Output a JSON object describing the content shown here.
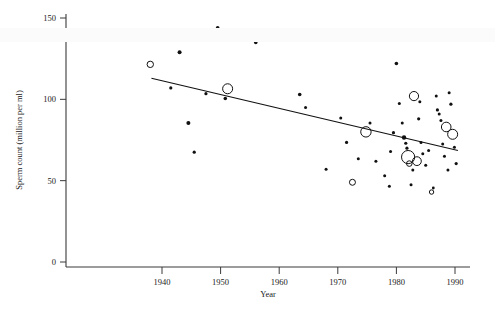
{
  "figure": {
    "title": "",
    "background_color": "#ffffff",
    "point_color": "#111111"
  },
  "axes": {
    "x_title": "Year",
    "y_title": "Sperm count (million per ml)",
    "x_ticks": [
      "1940",
      "1950",
      "1960",
      "1970",
      "1980",
      "1990"
    ],
    "y_ticks": [
      "0",
      "50",
      "100",
      "150"
    ]
  },
  "chart_data": {
    "type": "scatter",
    "title": "",
    "xlabel": "Year",
    "ylabel": "Sperm count (million per ml)",
    "xlim": [
      1936,
      1992
    ],
    "ylim": [
      0,
      155
    ],
    "xticks": [
      1940,
      1950,
      1960,
      1970,
      1980,
      1990
    ],
    "yticks": [
      0,
      50,
      100,
      150
    ],
    "grid": false,
    "legend": null,
    "marker_note": "Marker area proportional to study sample size; small filled dots = small studies, large open circles = large studies",
    "points": [
      {
        "x": 1938.0,
        "y": 121.5,
        "size": 3.2,
        "style": "open"
      },
      {
        "x": 1941.5,
        "y": 107.0,
        "size": 1.6,
        "style": "filled"
      },
      {
        "x": 1943.0,
        "y": 129.0,
        "size": 2.0,
        "style": "filled"
      },
      {
        "x": 1944.5,
        "y": 85.5,
        "size": 2.0,
        "style": "filled"
      },
      {
        "x": 1945.5,
        "y": 67.5,
        "size": 1.6,
        "style": "filled"
      },
      {
        "x": 1947.5,
        "y": 103.5,
        "size": 1.6,
        "style": "filled"
      },
      {
        "x": 1949.5,
        "y": 144.0,
        "size": 1.8,
        "style": "filled"
      },
      {
        "x": 1950.8,
        "y": 100.5,
        "size": 1.8,
        "style": "filled"
      },
      {
        "x": 1951.2,
        "y": 106.5,
        "size": 5.0,
        "style": "open"
      },
      {
        "x": 1956.0,
        "y": 135.0,
        "size": 1.8,
        "style": "filled"
      },
      {
        "x": 1963.5,
        "y": 103.0,
        "size": 1.8,
        "style": "filled"
      },
      {
        "x": 1964.5,
        "y": 95.0,
        "size": 1.5,
        "style": "filled"
      },
      {
        "x": 1968.0,
        "y": 57.0,
        "size": 1.5,
        "style": "filled"
      },
      {
        "x": 1969.5,
        "y": 141.0,
        "size": 1.8,
        "style": "filled"
      },
      {
        "x": 1970.5,
        "y": 88.5,
        "size": 1.5,
        "style": "filled"
      },
      {
        "x": 1971.5,
        "y": 73.5,
        "size": 1.6,
        "style": "filled"
      },
      {
        "x": 1972.5,
        "y": 49.0,
        "size": 3.0,
        "style": "open"
      },
      {
        "x": 1974.8,
        "y": 80.0,
        "size": 5.2,
        "style": "open"
      },
      {
        "x": 1975.5,
        "y": 85.5,
        "size": 1.5,
        "style": "filled"
      },
      {
        "x": 1976.5,
        "y": 62.0,
        "size": 1.5,
        "style": "filled"
      },
      {
        "x": 1978.0,
        "y": 53.0,
        "size": 1.5,
        "style": "filled"
      },
      {
        "x": 1978.8,
        "y": 46.5,
        "size": 1.5,
        "style": "filled"
      },
      {
        "x": 1979.5,
        "y": 79.5,
        "size": 1.6,
        "style": "filled"
      },
      {
        "x": 1980.0,
        "y": 122.0,
        "size": 1.8,
        "style": "filled"
      },
      {
        "x": 1980.5,
        "y": 97.5,
        "size": 1.5,
        "style": "filled"
      },
      {
        "x": 1981.0,
        "y": 85.5,
        "size": 1.5,
        "style": "filled"
      },
      {
        "x": 1981.3,
        "y": 76.5,
        "size": 2.2,
        "style": "filled"
      },
      {
        "x": 1981.6,
        "y": 73.0,
        "size": 1.6,
        "style": "filled"
      },
      {
        "x": 1981.8,
        "y": 70.0,
        "size": 1.6,
        "style": "filled"
      },
      {
        "x": 1982.0,
        "y": 64.5,
        "size": 6.6,
        "style": "open"
      },
      {
        "x": 1982.2,
        "y": 60.5,
        "size": 2.8,
        "style": "open"
      },
      {
        "x": 1982.5,
        "y": 47.5,
        "size": 1.5,
        "style": "filled"
      },
      {
        "x": 1982.8,
        "y": 56.5,
        "size": 1.5,
        "style": "filled"
      },
      {
        "x": 1983.0,
        "y": 102.0,
        "size": 4.6,
        "style": "open"
      },
      {
        "x": 1983.5,
        "y": 62.0,
        "size": 4.4,
        "style": "open"
      },
      {
        "x": 1983.8,
        "y": 88.0,
        "size": 1.6,
        "style": "filled"
      },
      {
        "x": 1984.0,
        "y": 98.5,
        "size": 1.5,
        "style": "filled"
      },
      {
        "x": 1984.5,
        "y": 66.5,
        "size": 1.5,
        "style": "filled"
      },
      {
        "x": 1985.0,
        "y": 59.5,
        "size": 1.5,
        "style": "filled"
      },
      {
        "x": 1985.5,
        "y": 68.5,
        "size": 1.5,
        "style": "filled"
      },
      {
        "x": 1986.0,
        "y": 43.0,
        "size": 2.2,
        "style": "open"
      },
      {
        "x": 1986.3,
        "y": 45.5,
        "size": 1.4,
        "style": "filled"
      },
      {
        "x": 1986.8,
        "y": 102.0,
        "size": 1.5,
        "style": "filled"
      },
      {
        "x": 1987.0,
        "y": 93.5,
        "size": 1.6,
        "style": "filled"
      },
      {
        "x": 1987.3,
        "y": 91.0,
        "size": 1.5,
        "style": "filled"
      },
      {
        "x": 1987.6,
        "y": 87.0,
        "size": 1.5,
        "style": "filled"
      },
      {
        "x": 1987.9,
        "y": 72.5,
        "size": 1.5,
        "style": "filled"
      },
      {
        "x": 1988.2,
        "y": 65.0,
        "size": 1.5,
        "style": "filled"
      },
      {
        "x": 1988.5,
        "y": 83.0,
        "size": 4.8,
        "style": "open"
      },
      {
        "x": 1988.8,
        "y": 56.5,
        "size": 1.5,
        "style": "filled"
      },
      {
        "x": 1989.0,
        "y": 104.0,
        "size": 1.5,
        "style": "filled"
      },
      {
        "x": 1989.3,
        "y": 97.0,
        "size": 1.6,
        "style": "filled"
      },
      {
        "x": 1989.6,
        "y": 78.5,
        "size": 5.0,
        "style": "open"
      },
      {
        "x": 1989.9,
        "y": 70.5,
        "size": 1.5,
        "style": "filled"
      },
      {
        "x": 1990.2,
        "y": 60.5,
        "size": 1.6,
        "style": "filled"
      },
      {
        "x": 1984.2,
        "y": 73.5,
        "size": 1.5,
        "style": "filled"
      },
      {
        "x": 1979.0,
        "y": 68.0,
        "size": 1.5,
        "style": "filled"
      },
      {
        "x": 1973.5,
        "y": 63.5,
        "size": 1.5,
        "style": "filled"
      }
    ],
    "trendline": {
      "name": "linear regression",
      "x_start": 1938.2,
      "y_start": 113.0,
      "x_end": 1990.5,
      "y_end": 68.5
    }
  }
}
